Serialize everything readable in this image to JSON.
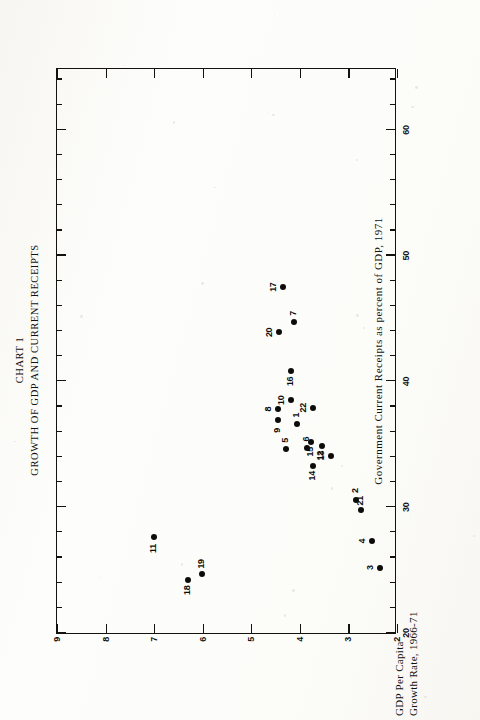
{
  "title": {
    "line1": "CHART 1",
    "line2": "GROWTH OF GDP AND CURRENT RECEIPTS"
  },
  "chart_data": {
    "type": "scatter",
    "xlabel": "Government Current Receipts as percent of GDP, 1971",
    "ylabel": "GDP Per Capita Growth Rate, 1966-71",
    "ylabel_line1": "GDP Per Capita",
    "ylabel_line2": "Growth Rate, 1966-71",
    "xlim": [
      20,
      65
    ],
    "ylim": [
      2,
      9
    ],
    "xticks": [
      20,
      30,
      40,
      50,
      60
    ],
    "xticks_minor_step": 2,
    "yticks": [
      2,
      3,
      4,
      5,
      6,
      7,
      8,
      9
    ],
    "grid": false,
    "legend": "none",
    "point_labels_shown": true,
    "points": [
      {
        "label": "1",
        "x": 36.6,
        "y": 4.05,
        "lab_dx": 9,
        "lab_dy": -1
      },
      {
        "label": "2",
        "x": 30.6,
        "y": 2.85,
        "lab_dx": 9,
        "lab_dy": -1
      },
      {
        "label": "3",
        "x": 25.2,
        "y": 2.35,
        "lab_dx": 0,
        "lab_dy": -10
      },
      {
        "label": "4",
        "x": 27.3,
        "y": 2.52,
        "lab_dx": 0,
        "lab_dy": -10
      },
      {
        "label": "5",
        "x": 34.6,
        "y": 4.28,
        "lab_dx": 9,
        "lab_dy": -1
      },
      {
        "label": "6",
        "x": 34.7,
        "y": 3.85,
        "lab_dx": 9,
        "lab_dy": -1
      },
      {
        "label": "7",
        "x": 44.7,
        "y": 4.12,
        "lab_dx": 9,
        "lab_dy": -1
      },
      {
        "label": "8",
        "x": 37.8,
        "y": 4.45,
        "lab_dx": 0,
        "lab_dy": -10
      },
      {
        "label": "9",
        "x": 36.9,
        "y": 4.45,
        "lab_dx": -10,
        "lab_dy": -1
      },
      {
        "label": "10",
        "x": 38.5,
        "y": 4.18,
        "lab_dx": 0,
        "lab_dy": -10
      },
      {
        "label": "11",
        "x": 27.6,
        "y": 7.0,
        "lab_dx": -11,
        "lab_dy": -1
      },
      {
        "label": "12",
        "x": 34.1,
        "y": 3.35,
        "lab_dx": 0,
        "lab_dy": -11
      },
      {
        "label": "13",
        "x": 34.9,
        "y": 3.55,
        "lab_dx": -10,
        "lab_dy": -1
      },
      {
        "label": "14",
        "x": 33.3,
        "y": 3.72,
        "lab_dx": -10,
        "lab_dy": -1
      },
      {
        "label": "15",
        "x": 35.2,
        "y": 3.78,
        "lab_dx": -10,
        "lab_dy": -1
      },
      {
        "label": "16",
        "x": 40.8,
        "y": 4.18,
        "lab_dx": -10,
        "lab_dy": -1
      },
      {
        "label": "17",
        "x": 47.5,
        "y": 4.35,
        "lab_dx": 0,
        "lab_dy": -10
      },
      {
        "label": "18",
        "x": 24.2,
        "y": 6.3,
        "lab_dx": -10,
        "lab_dy": -1
      },
      {
        "label": "19",
        "x": 24.7,
        "y": 6.02,
        "lab_dx": 10,
        "lab_dy": -1
      },
      {
        "label": "20",
        "x": 43.9,
        "y": 4.42,
        "lab_dx": 0,
        "lab_dy": -10
      },
      {
        "label": "21",
        "x": 29.8,
        "y": 2.75,
        "lab_dx": 9,
        "lab_dy": -1
      },
      {
        "label": "22",
        "x": 37.9,
        "y": 3.72,
        "lab_dx": 0,
        "lab_dy": -10
      }
    ]
  }
}
